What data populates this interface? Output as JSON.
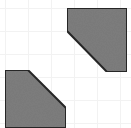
{
  "canvas": {
    "width": 131,
    "height": 128,
    "background_color": "#ffffff",
    "name": "shape-canvas"
  },
  "grid": {
    "visible": true,
    "line_color": "#f2f2f2",
    "line_width": 1,
    "spacing": 23,
    "origin_x": 5,
    "origin_y": 8,
    "vertical_lines": [
      5,
      28,
      51,
      74,
      97,
      120
    ],
    "horizontal_lines": [
      8,
      31,
      54,
      77,
      100,
      123
    ]
  },
  "shapes": [
    {
      "id": "shape-top-right",
      "name": "pentagon-top-right",
      "label": "Top right cut-corner square",
      "fill_color": "#7d7d7d",
      "stroke_color": "#262626",
      "stroke_width": 2,
      "cut_corner": "bottom-left",
      "points": "67,8 127,8 127,72 107,72 67,31",
      "vertices": [
        [
          67,
          8
        ],
        [
          127,
          8
        ],
        [
          127,
          72
        ],
        [
          107,
          72
        ],
        [
          67,
          31
        ]
      ]
    },
    {
      "id": "shape-bottom-left",
      "name": "pentagon-bottom-left",
      "label": "Bottom left cut-corner square",
      "fill_color": "#7d7d7d",
      "stroke_color": "#262626",
      "stroke_width": 2,
      "cut_corner": "top-right",
      "points": "5,70 28,70 66,108 66,128 5,128",
      "vertices": [
        [
          5,
          70
        ],
        [
          28,
          70
        ],
        [
          66,
          108
        ],
        [
          66,
          128
        ],
        [
          5,
          128
        ]
      ]
    }
  ]
}
